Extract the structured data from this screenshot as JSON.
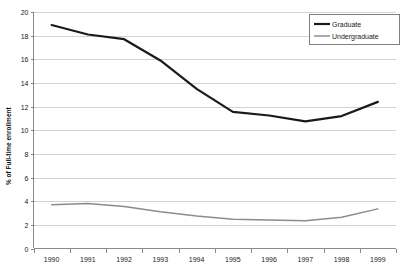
{
  "chart_data": {
    "type": "line",
    "title": "",
    "xlabel": "",
    "ylabel": "% of Full-time enrollment",
    "categories": [
      "1990",
      "1991",
      "1992",
      "1993",
      "1994",
      "1995",
      "1996",
      "1997",
      "1998",
      "1999"
    ],
    "x": [
      1990,
      1991,
      1992,
      1993,
      1994,
      1995,
      1996,
      1997,
      1998,
      1999
    ],
    "xlim": [
      1990,
      1999
    ],
    "ylim": [
      0,
      20
    ],
    "yticks": [
      0,
      2,
      4,
      6,
      8,
      10,
      12,
      14,
      16,
      18,
      20
    ],
    "grid": "horizontal",
    "legend_position": "top-right",
    "series": [
      {
        "name": "Graduate",
        "color": "#1a1a1a",
        "values": [
          18.9,
          18.1,
          17.7,
          15.9,
          13.5,
          11.55,
          11.25,
          10.75,
          11.2,
          12.4
        ]
      },
      {
        "name": "Undergraduate",
        "color": "#8c8c8c",
        "values": [
          3.7,
          3.8,
          3.55,
          3.1,
          2.75,
          2.48,
          2.4,
          2.35,
          2.65,
          3.35
        ]
      }
    ]
  },
  "axes": {
    "y_title": "% of Full-time enrollment",
    "y_tick_labels": [
      "20",
      "18",
      "16",
      "14",
      "12",
      "10",
      "8",
      "6",
      "4",
      "2",
      "0"
    ],
    "x_tick_labels": [
      "1990",
      "1991",
      "1992",
      "1993",
      "1994",
      "1995",
      "1996",
      "1997",
      "1998",
      "1999"
    ]
  },
  "legend": {
    "entries": [
      {
        "label": "Graduate",
        "color": "#1a1a1a"
      },
      {
        "label": "Undergraduate",
        "color": "#8c8c8c"
      }
    ]
  },
  "colors": {
    "graduate": "#1a1a1a",
    "undergraduate": "#8c8c8c",
    "grid": "#b6b6b6",
    "axis": "#6b6b6b",
    "background": "#ffffff"
  }
}
